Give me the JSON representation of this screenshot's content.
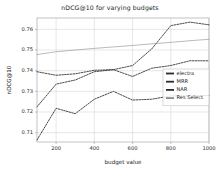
{
  "chart_data": {
    "type": "line",
    "title": "nDCG@10 for varying budgets",
    "xlabel": "budget value",
    "ylabel": "nDCG@10",
    "xlim": [
      100,
      1000
    ],
    "ylim": [
      0.7055,
      0.7655
    ],
    "xticks": [
      200,
      400,
      600,
      800,
      1000
    ],
    "xticklabels": [
      "200",
      "400",
      "600",
      "800",
      "1000"
    ],
    "yticks": [
      0.71,
      0.72,
      0.73,
      0.74,
      0.75,
      0.76
    ],
    "yticklabels": [
      "0.71",
      "0.72",
      "0.73",
      "0.74",
      "0.75",
      "0.76"
    ],
    "grid": true,
    "legend_position": "center-right",
    "x": [
      100,
      200,
      300,
      400,
      500,
      600,
      700,
      800,
      900,
      1000
    ],
    "series": [
      {
        "name": "electra",
        "color": "#2b2b2b",
        "style": "dashed",
        "values": [
          0.7225,
          0.7335,
          0.7355,
          0.7395,
          0.7405,
          0.7425,
          0.7505,
          0.7618,
          0.7635,
          0.7622
        ]
      },
      {
        "name": "MRR",
        "color": "#2b2b2b",
        "style": "dashed",
        "values": [
          0.7395,
          0.7378,
          0.7385,
          0.7402,
          0.7405,
          0.7372,
          0.7412,
          0.7425,
          0.7448,
          0.7448
        ]
      },
      {
        "name": "NAR",
        "color": "#2b2b2b",
        "style": "dashed",
        "values": [
          0.7065,
          0.7218,
          0.7192,
          0.7262,
          0.73,
          0.7258,
          0.7262,
          0.7278,
          0.728,
          0.728
        ]
      },
      {
        "name": "Res Select",
        "color": "#8c8c8c",
        "style": "solid",
        "values": [
          0.7478,
          0.7492,
          0.75,
          0.7508,
          0.7515,
          0.7522,
          0.753,
          0.7537,
          0.7545,
          0.7552
        ]
      }
    ]
  },
  "legend": {
    "entries": [
      {
        "label": "electra"
      },
      {
        "label": "MRR"
      },
      {
        "label": "NAR"
      },
      {
        "label": "Res Select"
      }
    ]
  },
  "colors": {
    "background": "#ffffff",
    "grid": "#cfcfcf",
    "axis": "#9a9a9a",
    "text": "#1a1a1a"
  }
}
